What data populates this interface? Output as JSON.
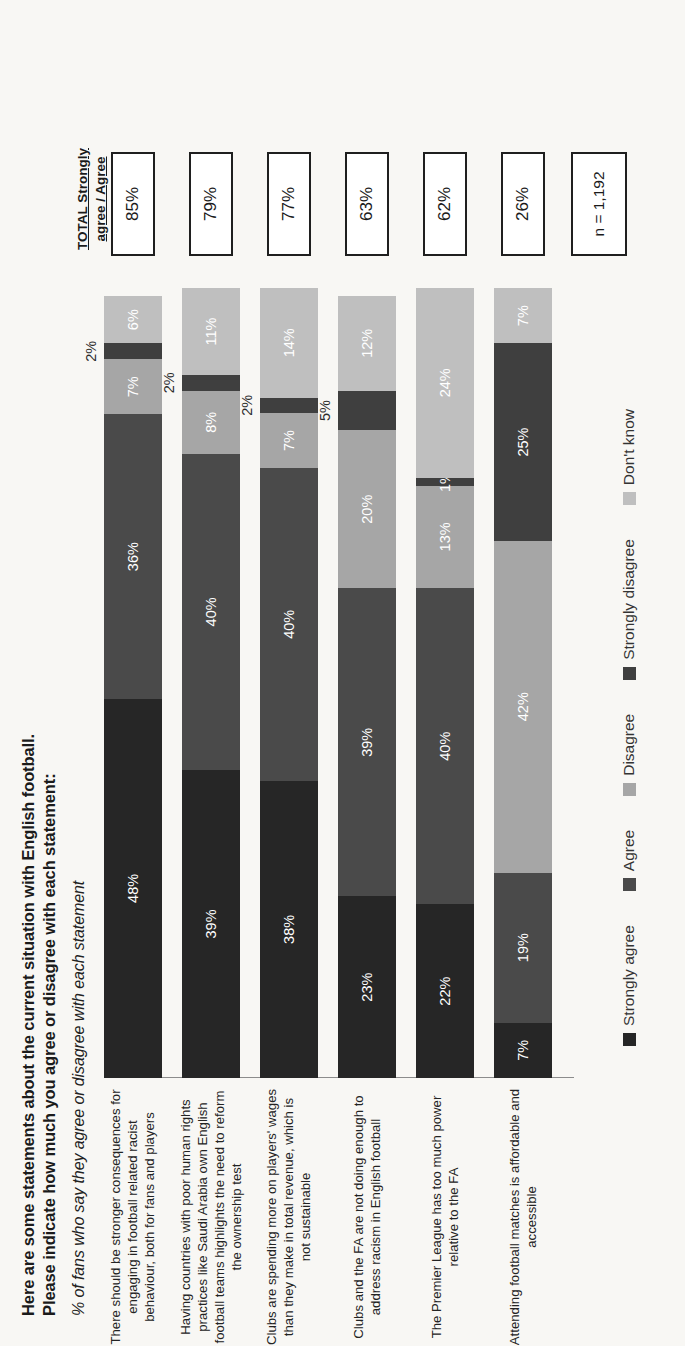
{
  "title": {
    "line1": "Here are some statements about the current situation with English football.",
    "line2": "Please indicate how much you agree or disagree with each statement:",
    "subtitle": "% of fans who say they agree or disagree with each statement"
  },
  "total_header": {
    "line1": "TOTAL Strongly",
    "line2": "agree / Agree"
  },
  "sample_size": "n = 1,192",
  "colors": {
    "strongly_agree": "#262626",
    "agree": "#4a4a4a",
    "disagree": "#a6a6a6",
    "strongly_disagree": "#3f3f3f",
    "dont_know": "#bfbfbf",
    "background": "#f8f7f4",
    "text": "#232323"
  },
  "chart_data": {
    "type": "bar",
    "subtype": "100% stacked horizontal bar",
    "title": "Here are some statements about the current situation with English football. Please indicate how much you agree or disagree with each statement:",
    "subtitle": "% of fans who say they agree or disagree with each statement",
    "xlabel": "",
    "ylabel": "",
    "xlim": [
      0,
      100
    ],
    "grid": false,
    "legend_position": "bottom",
    "legend": [
      "Strongly agree",
      "Agree",
      "Disagree",
      "Strongly disagree",
      "Don't know"
    ],
    "categories": [
      "There should be stronger consequences for engaging in football related racist behaviour, both for fans and players",
      "Having countries with poor human rights practices like Saudi Arabia own English football teams highlights the need to reform the ownership test",
      "Clubs are spending more on players' wages than they make in total revenue, which is not sustainable",
      "Clubs and the FA are not doing enough to address racism in English football",
      "The Premier League has too much power relative to the FA",
      "Attending football matches is affordable and accessible"
    ],
    "series": [
      {
        "name": "Strongly agree",
        "values": [
          48,
          39,
          38,
          23,
          22,
          7
        ]
      },
      {
        "name": "Agree",
        "values": [
          36,
          40,
          40,
          39,
          40,
          19
        ]
      },
      {
        "name": "Disagree",
        "values": [
          7,
          8,
          7,
          20,
          13,
          42
        ]
      },
      {
        "name": "Strongly disagree",
        "values": [
          2,
          2,
          2,
          5,
          1,
          25
        ]
      },
      {
        "name": "Don't know",
        "values": [
          6,
          11,
          14,
          12,
          24,
          7
        ]
      }
    ],
    "totals_label": "TOTAL Strongly agree / Agree",
    "totals": [
      85,
      79,
      77,
      63,
      62,
      26
    ],
    "sample_size": "n = 1,192"
  },
  "rows": [
    {
      "label": "There should be stronger consequences for engaging in football related racist behaviour, both for fans and players",
      "total": "85%",
      "segments": [
        {
          "key": "strongly_agree",
          "value": 48,
          "text": "48%",
          "placement": "inside"
        },
        {
          "key": "agree",
          "value": 36,
          "text": "36%",
          "placement": "inside"
        },
        {
          "key": "disagree",
          "value": 7,
          "text": "7%",
          "placement": "inside"
        },
        {
          "key": "strongly_disagree",
          "value": 2,
          "text": "2%",
          "placement": "outside"
        },
        {
          "key": "dont_know",
          "value": 6,
          "text": "6%",
          "placement": "inside"
        }
      ]
    },
    {
      "label": "Having countries with poor human rights practices like Saudi Arabia own English football teams highlights the need to reform the ownership test",
      "total": "79%",
      "segments": [
        {
          "key": "strongly_agree",
          "value": 39,
          "text": "39%",
          "placement": "inside"
        },
        {
          "key": "agree",
          "value": 40,
          "text": "40%",
          "placement": "inside"
        },
        {
          "key": "disagree",
          "value": 8,
          "text": "8%",
          "placement": "inside"
        },
        {
          "key": "strongly_disagree",
          "value": 2,
          "text": "2%",
          "placement": "outside"
        },
        {
          "key": "dont_know",
          "value": 11,
          "text": "11%",
          "placement": "inside"
        }
      ]
    },
    {
      "label": "Clubs are spending more on players' wages than they make in total revenue, which is not sustainable",
      "total": "77%",
      "segments": [
        {
          "key": "strongly_agree",
          "value": 38,
          "text": "38%",
          "placement": "inside"
        },
        {
          "key": "agree",
          "value": 40,
          "text": "40%",
          "placement": "inside"
        },
        {
          "key": "disagree",
          "value": 7,
          "text": "7%",
          "placement": "inside"
        },
        {
          "key": "strongly_disagree",
          "value": 2,
          "text": "2%",
          "placement": "outside"
        },
        {
          "key": "dont_know",
          "value": 14,
          "text": "14%",
          "placement": "inside"
        }
      ]
    },
    {
      "label": "Clubs and the FA are not doing enough to address racism in English football",
      "total": "63%",
      "segments": [
        {
          "key": "strongly_agree",
          "value": 23,
          "text": "23%",
          "placement": "inside"
        },
        {
          "key": "agree",
          "value": 39,
          "text": "39%",
          "placement": "inside"
        },
        {
          "key": "disagree",
          "value": 20,
          "text": "20%",
          "placement": "inside"
        },
        {
          "key": "strongly_disagree",
          "value": 5,
          "text": "5%",
          "placement": "outside"
        },
        {
          "key": "dont_know",
          "value": 12,
          "text": "12%",
          "placement": "inside"
        }
      ]
    },
    {
      "label": "The Premier League has too much power relative to the FA",
      "total": "62%",
      "segments": [
        {
          "key": "strongly_agree",
          "value": 22,
          "text": "22%",
          "placement": "inside"
        },
        {
          "key": "agree",
          "value": 40,
          "text": "40%",
          "placement": "inside"
        },
        {
          "key": "disagree",
          "value": 13,
          "text": "13%",
          "placement": "inside"
        },
        {
          "key": "strongly_disagree",
          "value": 1,
          "text": "1%",
          "placement": "inside-overflow"
        },
        {
          "key": "dont_know",
          "value": 24,
          "text": "24%",
          "placement": "inside"
        }
      ]
    },
    {
      "label": "Attending football matches is affordable and accessible",
      "total": "26%",
      "segments": [
        {
          "key": "strongly_agree",
          "value": 7,
          "text": "7%",
          "placement": "inside"
        },
        {
          "key": "agree",
          "value": 19,
          "text": "19%",
          "placement": "inside"
        },
        {
          "key": "disagree",
          "value": 42,
          "text": "42%",
          "placement": "inside"
        },
        {
          "key": "strongly_disagree",
          "value": 25,
          "text": "25%",
          "placement": "inside"
        },
        {
          "key": "dont_know",
          "value": 7,
          "text": "7%",
          "placement": "inside"
        }
      ]
    }
  ],
  "legend": [
    {
      "label": "Strongly agree",
      "key": "strongly_agree"
    },
    {
      "label": "Agree",
      "key": "agree"
    },
    {
      "label": "Disagree",
      "key": "disagree"
    },
    {
      "label": "Strongly disagree",
      "key": "strongly_disagree"
    },
    {
      "label": "Don't know",
      "key": "dont_know"
    }
  ]
}
